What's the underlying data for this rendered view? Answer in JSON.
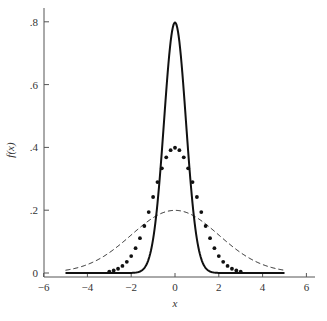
{
  "chart_data": {
    "type": "line",
    "title": "",
    "xlabel": "x",
    "ylabel": "f(x)",
    "xlim": [
      -6,
      6
    ],
    "ylim": [
      0,
      0.85
    ],
    "xticks": [
      -6,
      -4,
      -2,
      0,
      2,
      4,
      6
    ],
    "xtick_labels": [
      "−6",
      "−4",
      "−2",
      "0",
      "2",
      "4",
      "6"
    ],
    "yticks": [
      0,
      0.2,
      0.4,
      0.6,
      0.8
    ],
    "ytick_labels": [
      "0",
      ".2",
      ".4",
      ".6",
      ".8"
    ],
    "grid": false,
    "legend": null,
    "series": [
      {
        "name": "Normal, mean 0, sd 0.5",
        "style": "solid",
        "mean": 0,
        "sd": 0.5,
        "x_range": [
          -5,
          5
        ],
        "peak": 0.798
      },
      {
        "name": "Normal, mean 0, sd 1",
        "style": "dotted",
        "mean": 0,
        "sd": 1,
        "x_range": [
          -3,
          3
        ],
        "peak": 0.399
      },
      {
        "name": "Normal, mean 0, sd 2",
        "style": "dashed",
        "mean": 0,
        "sd": 2,
        "x_range": [
          -5,
          5
        ],
        "peak": 0.199
      }
    ]
  },
  "axes": {
    "x_label": "x",
    "y_label": "f(x)"
  }
}
